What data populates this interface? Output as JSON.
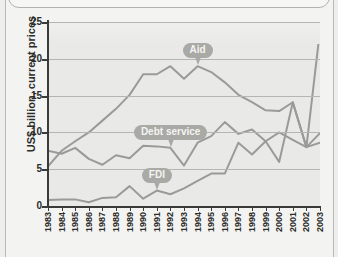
{
  "page": {
    "background_color": "#f3f3f1",
    "plot_background_color": "#e9e9e7"
  },
  "chart_data": {
    "type": "line",
    "title": "",
    "xlabel": "",
    "ylabel": "US$ billion, current prices",
    "ylim": [
      0,
      25
    ],
    "yticks": [
      0,
      5,
      10,
      15,
      20,
      25
    ],
    "grid": true,
    "legend_position": "inline-callouts",
    "line_color": "#9a9a96",
    "categories": [
      "1983",
      "1984",
      "1985",
      "1986",
      "1987",
      "1988",
      "1989",
      "1990",
      "1991",
      "1992",
      "1993",
      "1994",
      "1995",
      "1996",
      "1997",
      "1998",
      "1999",
      "2000",
      "2001",
      "2002",
      "2003"
    ],
    "series": [
      {
        "name": "Aid",
        "label": "Aid",
        "color": "#9a9a96",
        "values": [
          5.4,
          7.5,
          8.8,
          10.0,
          11.6,
          13.2,
          15.1,
          17.9,
          17.9,
          19.0,
          17.3,
          19.0,
          18.2,
          16.8,
          15.1,
          14.1,
          13.0,
          12.9,
          14.1,
          8.0,
          9.9
        ]
      },
      {
        "name": "Debt service",
        "label": "Debt service",
        "color": "#9a9a96",
        "values": [
          7.5,
          7.1,
          7.9,
          6.4,
          5.6,
          6.9,
          6.5,
          8.2,
          8.1,
          7.9,
          5.5,
          8.6,
          9.5,
          11.4,
          9.8,
          10.4,
          8.8,
          10.0,
          9.0,
          8.0,
          8.6
        ]
      },
      {
        "name": "FDI",
        "label": "FDI",
        "color": "#9a9a96",
        "values": [
          0.8,
          0.9,
          0.9,
          0.5,
          1.1,
          1.2,
          2.7,
          1.0,
          2.1,
          1.6,
          2.4,
          3.4,
          4.4,
          4.4,
          8.6,
          7.0,
          8.8,
          6.0,
          14.1,
          8.0,
          23.9
        ]
      }
    ],
    "annotations": [
      {
        "text": "Aid",
        "series": "Aid",
        "x": "1994",
        "y": 19.0
      },
      {
        "text": "Debt service",
        "series": "Debt service",
        "x": "1992",
        "y": 7.9
      },
      {
        "text": "FDI",
        "series": "FDI",
        "x": "1991",
        "y": 2.1
      }
    ]
  }
}
